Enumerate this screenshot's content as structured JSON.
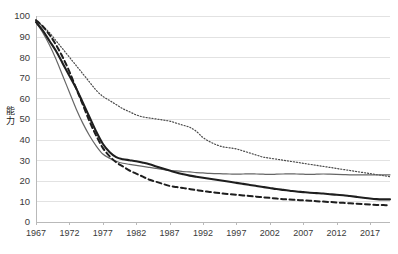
{
  "chart_data": {
    "type": "line",
    "title": "",
    "subtitle": "",
    "xlabel": "",
    "ylabel": "能力",
    "ylabel_chars": [
      "能",
      "力"
    ],
    "xlim": [
      1967,
      2020
    ],
    "ylim": [
      0,
      100
    ],
    "ytick_step": 10,
    "xtick_step": 5,
    "grid": "horizontal",
    "legend_position": "none",
    "yticks": [
      0,
      10,
      20,
      30,
      40,
      50,
      60,
      70,
      80,
      90,
      100
    ],
    "xticks": [
      1967,
      1972,
      1977,
      1982,
      1987,
      1992,
      1997,
      2002,
      2007,
      2012,
      2017
    ],
    "x": [
      1967,
      1968,
      1969,
      1970,
      1971,
      1972,
      1973,
      1974,
      1975,
      1976,
      1977,
      1978,
      1979,
      1980,
      1981,
      1982,
      1983,
      1984,
      1985,
      1986,
      1987,
      1988,
      1989,
      1990,
      1991,
      1992,
      1993,
      1994,
      1995,
      1996,
      1997,
      1998,
      1999,
      2000,
      2001,
      2002,
      2003,
      2004,
      2005,
      2006,
      2007,
      2008,
      2009,
      2010,
      2011,
      2012,
      2013,
      2014,
      2015,
      2016,
      2017,
      2018,
      2019,
      2020
    ],
    "series": [
      {
        "name": "dotted-series",
        "style": "dotted",
        "color": "#4a4a4a",
        "width": 1.2,
        "values": [
          98,
          95,
          92,
          88,
          84,
          80,
          76,
          72,
          68,
          64,
          61,
          59,
          57,
          55,
          53.5,
          52,
          51,
          50.5,
          50,
          49.5,
          49,
          48,
          47,
          46,
          44,
          41,
          39,
          37.5,
          36.5,
          36,
          35.5,
          34.5,
          33.5,
          32.5,
          31.5,
          31,
          30.5,
          30,
          29.5,
          29,
          28.5,
          28,
          27.5,
          27,
          26.5,
          26,
          25.5,
          25,
          24.5,
          24,
          23.5,
          23,
          22.5,
          22
        ]
      },
      {
        "name": "thin-solid-series",
        "style": "solid-thin",
        "color": "#666666",
        "width": 1.2,
        "values": [
          97,
          92,
          86,
          79,
          71,
          63,
          55,
          48,
          42,
          37,
          33,
          31,
          29.5,
          28.5,
          28,
          27.5,
          27,
          26.5,
          26,
          25.5,
          25,
          24.8,
          24.5,
          24.3,
          24,
          23.8,
          23.6,
          23.5,
          23.4,
          23.3,
          23.2,
          23.3,
          23.4,
          23.3,
          23.2,
          23.1,
          23.2,
          23.3,
          23.4,
          23.3,
          23.2,
          23.1,
          23.2,
          23.3,
          23.2,
          23.1,
          23,
          22.9,
          22.9,
          22.9,
          22.9,
          22.9,
          22.9,
          22.9
        ]
      },
      {
        "name": "thick-solid-series",
        "style": "solid-thick",
        "color": "#1e1e1e",
        "width": 2.1,
        "values": [
          97,
          93,
          88,
          83,
          77,
          71,
          65,
          58,
          51,
          44,
          38,
          34,
          31.5,
          30.5,
          30,
          29.5,
          28.8,
          28,
          27,
          26,
          25,
          24,
          23.2,
          22.5,
          22,
          21.5,
          21,
          20.5,
          20,
          19.5,
          19,
          18.5,
          18,
          17.5,
          17,
          16.5,
          16,
          15.6,
          15.2,
          14.8,
          14.5,
          14.2,
          14,
          13.8,
          13.5,
          13.2,
          13,
          12.6,
          12.2,
          11.8,
          11.4,
          11.1,
          11,
          11
        ]
      },
      {
        "name": "dashed-series",
        "style": "dashed",
        "color": "#1e1e1e",
        "width": 2.0,
        "values": [
          98,
          95,
          91,
          86,
          80,
          73,
          65,
          57,
          49,
          42,
          36,
          32,
          29,
          27,
          25,
          23.5,
          22,
          20.5,
          19.5,
          18.5,
          17.5,
          17,
          16.5,
          16,
          15.5,
          15,
          14.6,
          14.2,
          13.8,
          13.5,
          13.2,
          12.9,
          12.6,
          12.3,
          12,
          11.7,
          11.4,
          11.1,
          10.9,
          10.7,
          10.5,
          10.3,
          10.1,
          9.9,
          9.7,
          9.5,
          9.3,
          9.1,
          8.9,
          8.7,
          8.5,
          8.3,
          8.2,
          8.1
        ]
      }
    ]
  },
  "plot_geometry": {
    "left": 36,
    "top": 16,
    "right": 390,
    "bottom": 222
  }
}
